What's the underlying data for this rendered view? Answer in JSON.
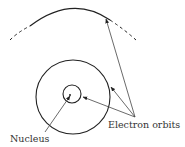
{
  "diagram": {
    "labels": {
      "electron_orbits": "Electron orbits",
      "nucleus": "Nucleus"
    },
    "colors": {
      "stroke": "#222222",
      "text": "#333333"
    }
  }
}
